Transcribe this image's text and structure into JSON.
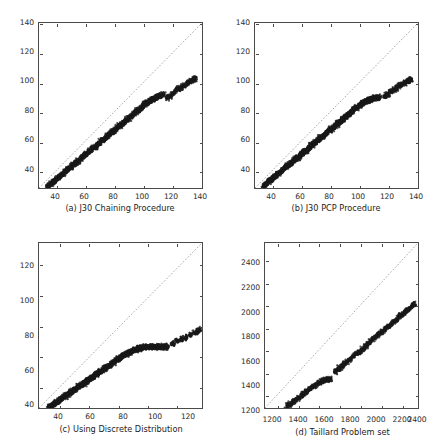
{
  "figure": {
    "type": "scatter-grid",
    "panel_count": 4,
    "background_color": "#ffffff",
    "point_color": "#1a1a1a",
    "diagonal_line_color": "#7a7a7a",
    "axis_color": "#4a4a4a"
  },
  "chart_data": [
    {
      "type": "scatter",
      "panel": "a",
      "title": "(a) J30 Chaining Procedure",
      "xlabel": "",
      "ylabel": "",
      "xlim": [
        28,
        141
      ],
      "ylim": [
        28,
        141
      ],
      "xticks": [
        40,
        60,
        80,
        100,
        120,
        140
      ],
      "yticks": [
        40,
        60,
        80,
        100,
        120,
        140
      ],
      "grid": false,
      "legend": null,
      "annotations": [
        "dotted identity line y = x"
      ],
      "series": [
        {
          "name": "instances",
          "description": "dense band of points lying below the identity line",
          "x": [
            34,
            35,
            36,
            37,
            38,
            39,
            40,
            41,
            42,
            43,
            44,
            45,
            46,
            47,
            48,
            49,
            50,
            51,
            52,
            53,
            54,
            55,
            56,
            57,
            58,
            59,
            60,
            61,
            62,
            63,
            64,
            65,
            66,
            67,
            68,
            69,
            70,
            71,
            72,
            73,
            74,
            75,
            76,
            77,
            78,
            79,
            80,
            81,
            82,
            83,
            84,
            85,
            86,
            87,
            88,
            89,
            90,
            91,
            92,
            93,
            94,
            95,
            96,
            97,
            98,
            99,
            100,
            101,
            102,
            103,
            104,
            105,
            106,
            107,
            108,
            109,
            110,
            111,
            112,
            113,
            114,
            117,
            119,
            121,
            123,
            125,
            127,
            129,
            131,
            133,
            135,
            136
          ],
          "y": [
            29,
            30,
            31,
            31,
            32,
            33,
            34,
            35,
            36,
            36,
            37,
            38,
            39,
            40,
            41,
            41,
            42,
            43,
            44,
            45,
            46,
            46,
            47,
            48,
            49,
            50,
            51,
            51,
            52,
            53,
            54,
            55,
            56,
            56,
            57,
            58,
            59,
            60,
            61,
            61,
            62,
            63,
            64,
            65,
            66,
            66,
            67,
            68,
            69,
            70,
            71,
            71,
            72,
            73,
            74,
            75,
            76,
            76,
            77,
            78,
            79,
            80,
            81,
            81,
            82,
            83,
            84,
            85,
            86,
            86,
            87,
            88,
            88,
            89,
            89,
            90,
            90,
            91,
            91,
            92,
            92,
            90,
            91,
            93,
            95,
            96,
            97,
            98,
            100,
            101,
            102,
            103
          ]
        },
        {
          "name": "identity",
          "description": "reference diagonal",
          "x": [
            28,
            141
          ],
          "y": [
            28,
            141
          ]
        }
      ]
    },
    {
      "type": "scatter",
      "panel": "b",
      "title": "(b) J30 PCP Procedure",
      "xlabel": "",
      "ylabel": "",
      "xlim": [
        28,
        141
      ],
      "ylim": [
        28,
        141
      ],
      "xticks": [
        40,
        60,
        80,
        100,
        120,
        140
      ],
      "yticks": [
        40,
        60,
        80,
        100,
        120,
        140
      ],
      "grid": false,
      "legend": null,
      "annotations": [
        "dotted identity line y = x"
      ],
      "series": [
        {
          "name": "instances",
          "description": "dense band of points lying below the identity line",
          "x": [
            34,
            35,
            36,
            37,
            38,
            39,
            40,
            41,
            42,
            43,
            44,
            45,
            46,
            47,
            48,
            49,
            50,
            51,
            52,
            53,
            54,
            55,
            56,
            57,
            58,
            59,
            60,
            61,
            62,
            63,
            64,
            65,
            66,
            67,
            68,
            69,
            70,
            71,
            72,
            73,
            74,
            75,
            76,
            77,
            78,
            79,
            80,
            81,
            82,
            83,
            84,
            85,
            86,
            87,
            88,
            89,
            90,
            91,
            92,
            93,
            94,
            95,
            96,
            97,
            98,
            99,
            100,
            101,
            102,
            103,
            104,
            105,
            106,
            107,
            108,
            109,
            110,
            111,
            112,
            113,
            114,
            118,
            120,
            122,
            124,
            126,
            128,
            130,
            132,
            134,
            135,
            136
          ],
          "y": [
            29,
            30,
            31,
            32,
            33,
            33,
            34,
            35,
            36,
            37,
            38,
            38,
            39,
            40,
            41,
            42,
            43,
            43,
            44,
            45,
            46,
            47,
            48,
            48,
            49,
            50,
            51,
            52,
            53,
            53,
            54,
            55,
            56,
            57,
            58,
            58,
            59,
            60,
            61,
            62,
            63,
            63,
            64,
            65,
            66,
            67,
            68,
            68,
            69,
            70,
            71,
            72,
            73,
            73,
            74,
            75,
            76,
            77,
            78,
            78,
            79,
            80,
            81,
            82,
            83,
            83,
            84,
            85,
            86,
            86,
            87,
            87,
            88,
            88,
            89,
            89,
            89,
            90,
            90,
            90,
            90,
            91,
            92,
            94,
            95,
            96,
            98,
            99,
            100,
            101,
            102,
            102
          ]
        },
        {
          "name": "identity",
          "description": "reference diagonal",
          "x": [
            28,
            141
          ],
          "y": [
            28,
            141
          ]
        }
      ]
    },
    {
      "type": "scatter",
      "panel": "c",
      "title": "(c) Using Discrete Distribution",
      "xlabel": "",
      "ylabel": "",
      "xlim": [
        26,
        138
      ],
      "ylim": [
        26,
        134
      ],
      "xticks": [
        40,
        60,
        80,
        100,
        120
      ],
      "yticks": [
        40,
        60,
        80,
        100,
        120
      ],
      "grid": false,
      "legend": null,
      "annotations": [
        "dotted identity line y = x"
      ],
      "series": [
        {
          "name": "instances",
          "description": "dense band of points lying well below the identity line",
          "x": [
            33,
            34,
            35,
            36,
            37,
            38,
            39,
            40,
            41,
            42,
            43,
            44,
            45,
            46,
            47,
            48,
            49,
            50,
            51,
            52,
            53,
            54,
            55,
            56,
            57,
            58,
            59,
            60,
            61,
            62,
            63,
            64,
            65,
            66,
            67,
            68,
            69,
            70,
            71,
            72,
            73,
            74,
            75,
            76,
            77,
            78,
            79,
            80,
            81,
            82,
            83,
            84,
            85,
            86,
            87,
            88,
            89,
            90,
            91,
            92,
            93,
            94,
            95,
            96,
            97,
            98,
            99,
            100,
            101,
            102,
            103,
            104,
            105,
            106,
            107,
            108,
            109,
            110,
            111,
            112,
            113,
            114,
            118,
            121,
            124,
            127,
            130,
            133,
            135,
            136
          ],
          "y": [
            27,
            27,
            28,
            28,
            29,
            30,
            30,
            31,
            32,
            32,
            33,
            34,
            34,
            35,
            36,
            36,
            37,
            38,
            38,
            39,
            40,
            40,
            41,
            42,
            42,
            43,
            44,
            44,
            45,
            46,
            46,
            47,
            48,
            48,
            49,
            50,
            50,
            51,
            52,
            52,
            53,
            54,
            54,
            55,
            56,
            56,
            57,
            58,
            58,
            59,
            60,
            60,
            61,
            61,
            62,
            62,
            63,
            63,
            64,
            64,
            64,
            65,
            65,
            65,
            65,
            66,
            66,
            66,
            66,
            66,
            66,
            66,
            66,
            66,
            66,
            66,
            66,
            66,
            66,
            66,
            66,
            66,
            68,
            70,
            71,
            72,
            74,
            75,
            76,
            77
          ]
        },
        {
          "name": "identity",
          "description": "reference diagonal",
          "x": [
            26,
            134
          ],
          "y": [
            26,
            134
          ]
        }
      ]
    },
    {
      "type": "scatter",
      "panel": "d",
      "title": "(d) Taillard Problem set",
      "xlabel": "",
      "ylabel": "",
      "xlim": [
        1080,
        2560
      ],
      "ylim": [
        1080,
        2560
      ],
      "xticks": [
        1200,
        1400,
        1600,
        1800,
        2000,
        2200,
        2400
      ],
      "yticks": [
        1200,
        1400,
        1600,
        1800,
        2000,
        2200,
        2400
      ],
      "grid": false,
      "legend": null,
      "annotations": [
        "dotted identity line y = x",
        "clustered segmented band"
      ],
      "series": [
        {
          "name": "instances",
          "description": "clustered segments of points lying below the identity line",
          "x": [
            1290,
            1310,
            1330,
            1350,
            1370,
            1390,
            1410,
            1430,
            1450,
            1470,
            1490,
            1510,
            1530,
            1550,
            1570,
            1590,
            1610,
            1630,
            1650,
            1670,
            1690,
            1710,
            1760,
            1780,
            1800,
            1820,
            1840,
            1860,
            1880,
            1900,
            1930,
            1960,
            1980,
            2000,
            2020,
            2040,
            2060,
            2080,
            2100,
            2120,
            2140,
            2160,
            2180,
            2200,
            2220,
            2240,
            2260,
            2280,
            2300,
            2320,
            2340,
            2360,
            2380,
            2400,
            2420,
            2440,
            2460,
            2480,
            2500,
            2520
          ],
          "y": [
            1095,
            1105,
            1115,
            1130,
            1145,
            1160,
            1175,
            1190,
            1205,
            1220,
            1235,
            1250,
            1262,
            1275,
            1288,
            1300,
            1310,
            1320,
            1328,
            1334,
            1338,
            1342,
            1405,
            1420,
            1435,
            1450,
            1468,
            1485,
            1500,
            1515,
            1540,
            1560,
            1572,
            1582,
            1600,
            1620,
            1640,
            1660,
            1678,
            1695,
            1712,
            1728,
            1742,
            1755,
            1770,
            1785,
            1800,
            1815,
            1830,
            1848,
            1865,
            1880,
            1898,
            1915,
            1930,
            1945,
            1960,
            1975,
            1992,
            2010
          ]
        },
        {
          "name": "identity",
          "description": "reference diagonal",
          "x": [
            1080,
            2560
          ],
          "y": [
            1080,
            2560
          ]
        }
      ]
    }
  ],
  "panels": [
    {
      "id": "a",
      "caption": "(a) J30 Chaining Procedure",
      "yticklabels": [
        "40",
        "60",
        "80",
        "100",
        "120",
        "140"
      ],
      "xticklabels": [
        "40",
        "60",
        "80",
        "100",
        "120",
        "140"
      ]
    },
    {
      "id": "b",
      "caption": "(b) J30 PCP Procedure",
      "yticklabels": [
        "40",
        "60",
        "80",
        "100",
        "120",
        "140"
      ],
      "xticklabels": [
        "40",
        "60",
        "80",
        "100",
        "120",
        "140"
      ]
    },
    {
      "id": "c",
      "caption": "(c) Using Discrete Distribution",
      "yticklabels": [
        "40",
        "60",
        "80",
        "100",
        "120"
      ],
      "xticklabels": [
        "40",
        "60",
        "80",
        "100",
        "120"
      ]
    },
    {
      "id": "d",
      "caption": "(d) Taillard Problem set",
      "yticklabels": [
        "1200",
        "1400",
        "1600",
        "1800",
        "2000",
        "2200",
        "2400"
      ],
      "xticklabels": [
        "1200",
        "1400",
        "1600",
        "1800",
        "2000",
        "2200",
        "2400"
      ]
    }
  ]
}
